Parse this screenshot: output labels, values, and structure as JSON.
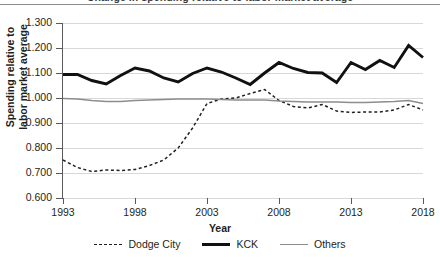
{
  "title_sliver": "Change in spending relative to labor market average",
  "axes": {
    "ylabel_line1": "Spending relative to",
    "ylabel_line2": "labor market average",
    "xlabel": "Year",
    "yticks": [
      "1.300",
      "1.200",
      "1.100",
      "1.000",
      "0.900",
      "0.800",
      "0.700",
      "0.600"
    ],
    "xticks": [
      "1993",
      "1998",
      "2003",
      "2008",
      "2013",
      "2018"
    ]
  },
  "legend": {
    "items": [
      {
        "label": "Dodge City",
        "style": "dashed",
        "color": "#231f20"
      },
      {
        "label": "KCK",
        "style": "thick",
        "color": "#111111"
      },
      {
        "label": "Others",
        "style": "thin",
        "color": "#8d8d8d"
      }
    ]
  },
  "chart_data": {
    "type": "line",
    "title": "Change in spending relative to labor market average",
    "xlabel": "Year",
    "ylabel": "Spending relative to labor market average",
    "xlim": [
      1993,
      2018
    ],
    "ylim": [
      0.6,
      1.3
    ],
    "ytick_step": 0.1,
    "grid": true,
    "legend_position": "bottom",
    "x": [
      1993,
      1994,
      1995,
      1996,
      1997,
      1998,
      1999,
      2000,
      2001,
      2002,
      2003,
      2004,
      2005,
      2006,
      2007,
      2008,
      2009,
      2010,
      2011,
      2012,
      2013,
      2014,
      2015,
      2016,
      2017,
      2018
    ],
    "series": [
      {
        "name": "Dodge City",
        "style": "dashed",
        "color": "#231f20",
        "values": [
          0.752,
          0.722,
          0.706,
          0.712,
          0.71,
          0.714,
          0.73,
          0.752,
          0.8,
          0.88,
          0.978,
          0.996,
          1.0,
          1.018,
          1.034,
          0.99,
          0.966,
          0.96,
          0.974,
          0.948,
          0.942,
          0.944,
          0.944,
          0.952,
          0.974,
          0.952
        ]
      },
      {
        "name": "KCK",
        "style": "thick",
        "color": "#111111",
        "values": [
          1.094,
          1.094,
          1.07,
          1.056,
          1.09,
          1.12,
          1.108,
          1.08,
          1.064,
          1.098,
          1.12,
          1.104,
          1.08,
          1.054,
          1.1,
          1.142,
          1.118,
          1.102,
          1.1,
          1.062,
          1.142,
          1.114,
          1.15,
          1.122,
          1.21,
          1.162
        ]
      },
      {
        "name": "Others",
        "style": "thin",
        "color": "#8d8d8d",
        "values": [
          0.998,
          0.996,
          0.99,
          0.986,
          0.986,
          0.99,
          0.992,
          0.994,
          0.996,
          0.996,
          0.996,
          0.994,
          0.992,
          0.992,
          0.992,
          0.988,
          0.986,
          0.984,
          0.984,
          0.984,
          0.982,
          0.982,
          0.984,
          0.986,
          0.99,
          0.978
        ]
      }
    ]
  }
}
